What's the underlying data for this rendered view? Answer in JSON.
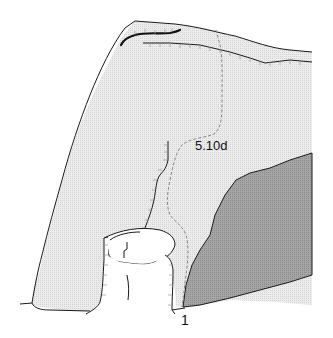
{
  "diagram": {
    "type": "climbing-route-topo",
    "route": {
      "grade": "5.10d",
      "start_marker": "1"
    },
    "colors": {
      "rock_light": "#e6e6e6",
      "rock_dark": "#9a9a9a",
      "outline": "#1a1a1a",
      "route_line": "#888888",
      "background": "#ffffff"
    }
  }
}
